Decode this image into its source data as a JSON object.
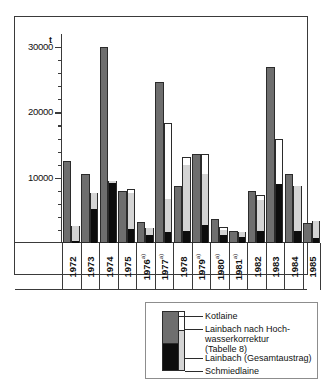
{
  "chart_data": {
    "type": "bar",
    "title": "",
    "xlabel": "",
    "ylabel": "t",
    "ylim": [
      0,
      32000
    ],
    "yticks": [
      10000,
      20000,
      30000
    ],
    "ytick_labels": [
      "10000",
      "20000",
      "30000"
    ],
    "grid": false,
    "legend_position": "bottom-right",
    "unit": "t",
    "categories": [
      "1972",
      "1973",
      "1974",
      "1975",
      "1976",
      "1977",
      "1978",
      "1979",
      "1980",
      "1981",
      "1982",
      "1983",
      "1984",
      "1985"
    ],
    "category_notes": [
      "",
      "",
      "",
      "",
      "a)",
      "a)",
      "",
      "a)",
      "a)",
      "a)",
      "",
      "",
      "",
      ""
    ],
    "series": [
      {
        "name": "Kotlaine",
        "color": "#6e6e6e",
        "values": [
          12600,
          10600,
          30000,
          8000,
          3200,
          24700,
          8800,
          13700,
          3700,
          1900,
          7900,
          26900,
          10600,
          3100
        ]
      },
      {
        "name": "Schmiedlaine",
        "color": "#0d0d0d",
        "values": [
          300,
          5200,
          9200,
          2100,
          1200,
          1700,
          1800,
          2800,
          1200,
          900,
          1900,
          9000,
          1900,
          700
        ]
      },
      {
        "name": "Lainbach (Gesamtaustrag)",
        "color": "#d4d4d4",
        "values": [
          2600,
          7700,
          9500,
          7700,
          2300,
          6700,
          12000,
          10600,
          2000,
          1700,
          6600,
          7800,
          8700,
          3400
        ]
      },
      {
        "name": "Lainbach nach Hochwasserkorrektur (Tabelle 8)",
        "color": "#ffffff",
        "values": [
          2600,
          7700,
          9500,
          8200,
          2300,
          18400,
          13100,
          13700,
          2500,
          1700,
          7300,
          16000,
          8700,
          3400
        ]
      }
    ]
  },
  "axis": {
    "unit_label": "t",
    "tick_30000": "30000",
    "tick_20000": "20000",
    "tick_10000": "10000"
  },
  "legend": {
    "items": [
      {
        "label": "Kotlaine",
        "swatch": "dark-gray"
      },
      {
        "label_line1": "Lainbach nach Hoch-",
        "label_line2": "wasserkorrektur",
        "label_line3": "(Tabelle 8)",
        "swatch": "white-outline"
      },
      {
        "label": "Lainbach (Gesamtaustrag)",
        "swatch": "light-gray"
      },
      {
        "label": "Schmiedlaine",
        "swatch": "black"
      }
    ]
  },
  "years": [
    {
      "label": "1972",
      "note": ""
    },
    {
      "label": "1973",
      "note": ""
    },
    {
      "label": "1974",
      "note": ""
    },
    {
      "label": "1975",
      "note": ""
    },
    {
      "label": "1976",
      "note": "a)"
    },
    {
      "label": "1977",
      "note": "a)"
    },
    {
      "label": "1978",
      "note": ""
    },
    {
      "label": "1979",
      "note": "a)"
    },
    {
      "label": "1980",
      "note": "a)"
    },
    {
      "label": "1981",
      "note": "a)"
    },
    {
      "label": "1982",
      "note": ""
    },
    {
      "label": "1983",
      "note": ""
    },
    {
      "label": "1984",
      "note": ""
    },
    {
      "label": "1985",
      "note": ""
    }
  ]
}
